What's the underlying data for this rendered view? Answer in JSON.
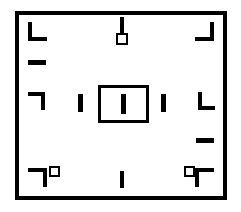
{
  "figure": {
    "canvas": {
      "width_px": 241,
      "height_px": 212,
      "background_color": "#ffffff",
      "ink_color": "#000000"
    },
    "frame": {
      "label": "outer-frame",
      "x": 15,
      "y": 11,
      "width": 212,
      "height": 189,
      "stroke_width": 4
    },
    "elements": [
      {
        "name": "corner-mark-top-left",
        "kind": "l-corner",
        "orientation": "opens-down-right",
        "x": 28,
        "y": 22,
        "width": 19,
        "height": 19,
        "stroke": 4
      },
      {
        "name": "corner-mark-top-right",
        "kind": "l-corner",
        "orientation": "opens-down-left",
        "x": 195,
        "y": 22,
        "width": 19,
        "height": 19,
        "stroke": 4
      },
      {
        "name": "corner-mark-bottom-left",
        "kind": "l-corner",
        "orientation": "opens-up-right",
        "x": 28,
        "y": 168,
        "width": 19,
        "height": 19,
        "stroke": 4
      },
      {
        "name": "corner-mark-bottom-right",
        "kind": "l-corner",
        "orientation": "opens-up-left",
        "x": 195,
        "y": 168,
        "width": 19,
        "height": 19,
        "stroke": 4
      },
      {
        "name": "corner-mark-left-middle",
        "kind": "l-corner",
        "orientation": "opens-up-right",
        "x": 28,
        "y": 92,
        "width": 17,
        "height": 18,
        "stroke": 4
      },
      {
        "name": "corner-mark-right-middle",
        "kind": "l-corner",
        "orientation": "opens-up-right",
        "x": 198,
        "y": 92,
        "width": 17,
        "height": 18,
        "stroke": 4
      },
      {
        "name": "dash-left-upper",
        "kind": "horizontal-dash",
        "x": 28,
        "y": 60,
        "width": 18,
        "height": 5
      },
      {
        "name": "dash-right-lower",
        "kind": "horizontal-dash",
        "x": 196,
        "y": 138,
        "width": 18,
        "height": 5
      },
      {
        "name": "bar-top-center",
        "kind": "vertical-bar",
        "x": 120,
        "y": 17,
        "width": 4,
        "height": 16
      },
      {
        "name": "square-top-center",
        "kind": "hollow-square",
        "x": 116,
        "y": 33,
        "width": 12,
        "height": 12,
        "stroke": 2
      },
      {
        "name": "bar-left-inner",
        "kind": "vertical-bar",
        "x": 78,
        "y": 94,
        "width": 5,
        "height": 18
      },
      {
        "name": "bar-right-inner",
        "kind": "vertical-bar",
        "x": 161,
        "y": 94,
        "width": 5,
        "height": 18
      },
      {
        "name": "center-rectangle",
        "kind": "hollow-rectangle",
        "x": 98,
        "y": 85,
        "width": 51,
        "height": 38,
        "stroke": 3
      },
      {
        "name": "bar-center",
        "kind": "vertical-bar",
        "x": 121,
        "y": 94,
        "width": 5,
        "height": 20
      },
      {
        "name": "square-bottom-left",
        "kind": "hollow-square",
        "x": 49,
        "y": 166,
        "width": 11,
        "height": 11,
        "stroke": 2
      },
      {
        "name": "square-bottom-right",
        "kind": "hollow-square",
        "x": 184,
        "y": 166,
        "width": 11,
        "height": 11,
        "stroke": 2
      },
      {
        "name": "bar-bottom-center",
        "kind": "vertical-bar",
        "x": 120,
        "y": 171,
        "width": 4,
        "height": 17
      }
    ]
  }
}
